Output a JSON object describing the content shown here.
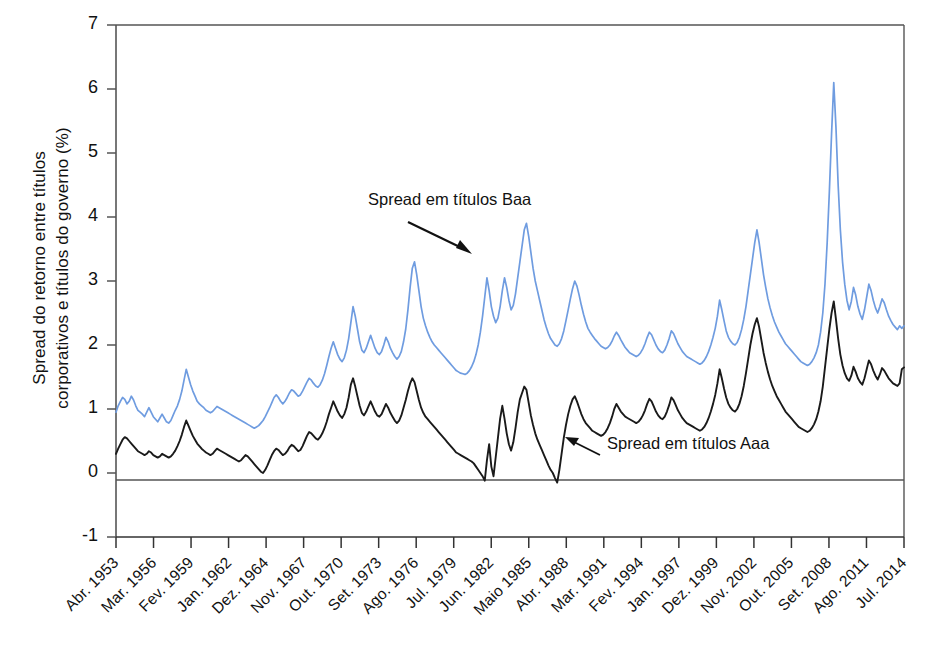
{
  "chart_data": {
    "type": "line",
    "title": "",
    "xlabel": "",
    "ylabel": "Spread do retorno entre títulos corporativos e títulos do governo (%)",
    "ylabel_line1": "Spread do retorno entre títulos",
    "ylabel_line2": "corporativos e títulos do governo (%)",
    "ylim": [
      -1,
      7
    ],
    "yticks": [
      -1,
      0,
      1,
      2,
      3,
      4,
      5,
      6,
      7
    ],
    "ytick_labels": [
      "-1",
      "0",
      "1",
      "2",
      "3",
      "4",
      "5",
      "6",
      "7"
    ],
    "grid": false,
    "zero_line": true,
    "legend_position": "inline-annotations",
    "x_tick_labels": [
      "Abr. 1953",
      "Mar. 1956",
      "Fev. 1959",
      "Jan. 1962",
      "Dez. 1964",
      "Nov. 1967",
      "Out. 1970",
      "Set. 1973",
      "Ago. 1976",
      "Jul. 1979",
      "Jun. 1982",
      "Maio 1985",
      "Abr. 1988",
      "Mar. 1991",
      "Fev. 1994",
      "Jan. 1997",
      "Dez. 1999",
      "Nov. 2002",
      "Out. 2005",
      "Set. 2008",
      "Ago. 2011",
      "Jul. 2014"
    ],
    "x_range": [
      "Abr. 1953",
      "Jul. 2014"
    ],
    "annotations": [
      {
        "text": "Spread em títulos Baa",
        "arrow": "down-right",
        "series": "Baa"
      },
      {
        "text": "Spread em títulos Aaa",
        "arrow": "up-left",
        "series": "Aaa"
      }
    ],
    "series": [
      {
        "name": "Spread em títulos Baa",
        "color": "#6f9ce0",
        "values": [
          0.95,
          1.05,
          1.12,
          1.18,
          1.15,
          1.08,
          1.12,
          1.2,
          1.14,
          1.05,
          0.98,
          0.95,
          0.92,
          0.88,
          0.95,
          1.02,
          0.95,
          0.88,
          0.84,
          0.8,
          0.86,
          0.92,
          0.86,
          0.8,
          0.78,
          0.82,
          0.9,
          0.98,
          1.05,
          1.15,
          1.28,
          1.45,
          1.62,
          1.5,
          1.38,
          1.28,
          1.2,
          1.12,
          1.08,
          1.05,
          1.02,
          0.98,
          0.96,
          0.94,
          0.96,
          1.0,
          1.04,
          1.02,
          1.0,
          0.98,
          0.96,
          0.94,
          0.92,
          0.9,
          0.88,
          0.86,
          0.84,
          0.82,
          0.8,
          0.78,
          0.76,
          0.74,
          0.72,
          0.7,
          0.72,
          0.74,
          0.78,
          0.82,
          0.88,
          0.95,
          1.02,
          1.1,
          1.18,
          1.22,
          1.18,
          1.12,
          1.08,
          1.12,
          1.18,
          1.25,
          1.3,
          1.28,
          1.24,
          1.2,
          1.22,
          1.28,
          1.35,
          1.42,
          1.48,
          1.45,
          1.4,
          1.36,
          1.34,
          1.38,
          1.45,
          1.55,
          1.68,
          1.82,
          1.95,
          2.05,
          1.95,
          1.85,
          1.78,
          1.74,
          1.8,
          1.92,
          2.1,
          2.35,
          2.6,
          2.45,
          2.25,
          2.05,
          1.92,
          1.88,
          1.95,
          2.05,
          2.15,
          2.05,
          1.95,
          1.88,
          1.85,
          1.9,
          2.0,
          2.12,
          2.05,
          1.95,
          1.88,
          1.82,
          1.78,
          1.82,
          1.9,
          2.05,
          2.25,
          2.55,
          2.9,
          3.2,
          3.3,
          3.1,
          2.85,
          2.6,
          2.42,
          2.3,
          2.2,
          2.12,
          2.05,
          2.0,
          1.96,
          1.92,
          1.88,
          1.84,
          1.8,
          1.76,
          1.72,
          1.68,
          1.64,
          1.6,
          1.58,
          1.56,
          1.55,
          1.54,
          1.56,
          1.6,
          1.66,
          1.74,
          1.85,
          2.0,
          2.2,
          2.45,
          2.75,
          3.05,
          2.85,
          2.6,
          2.45,
          2.35,
          2.42,
          2.6,
          2.85,
          3.05,
          2.9,
          2.7,
          2.55,
          2.62,
          2.8,
          3.05,
          3.3,
          3.55,
          3.8,
          3.9,
          3.7,
          3.45,
          3.2,
          3.0,
          2.85,
          2.7,
          2.55,
          2.4,
          2.28,
          2.18,
          2.1,
          2.05,
          2.0,
          1.98,
          2.02,
          2.1,
          2.22,
          2.38,
          2.55,
          2.72,
          2.88,
          3.0,
          2.92,
          2.78,
          2.62,
          2.48,
          2.36,
          2.26,
          2.2,
          2.15,
          2.1,
          2.06,
          2.02,
          1.98,
          1.96,
          1.94,
          1.96,
          2.0,
          2.06,
          2.14,
          2.2,
          2.15,
          2.08,
          2.02,
          1.96,
          1.92,
          1.88,
          1.86,
          1.84,
          1.82,
          1.84,
          1.88,
          1.94,
          2.02,
          2.12,
          2.2,
          2.16,
          2.08,
          2.0,
          1.94,
          1.9,
          1.88,
          1.92,
          2.0,
          2.1,
          2.22,
          2.18,
          2.1,
          2.02,
          1.96,
          1.9,
          1.86,
          1.82,
          1.8,
          1.78,
          1.76,
          1.74,
          1.72,
          1.7,
          1.72,
          1.76,
          1.82,
          1.9,
          2.0,
          2.12,
          2.26,
          2.45,
          2.7,
          2.55,
          2.38,
          2.22,
          2.12,
          2.06,
          2.02,
          2.0,
          2.04,
          2.12,
          2.24,
          2.4,
          2.6,
          2.85,
          3.1,
          3.35,
          3.6,
          3.8,
          3.6,
          3.35,
          3.1,
          2.9,
          2.72,
          2.58,
          2.46,
          2.36,
          2.28,
          2.2,
          2.14,
          2.08,
          2.02,
          1.98,
          1.94,
          1.9,
          1.86,
          1.82,
          1.78,
          1.74,
          1.72,
          1.7,
          1.68,
          1.7,
          1.74,
          1.8,
          1.88,
          2.0,
          2.2,
          2.5,
          2.95,
          3.6,
          4.4,
          5.3,
          6.1,
          5.4,
          4.5,
          3.8,
          3.3,
          2.95,
          2.7,
          2.55,
          2.68,
          2.9,
          2.78,
          2.6,
          2.48,
          2.4,
          2.55,
          2.75,
          2.95,
          2.85,
          2.7,
          2.58,
          2.5,
          2.6,
          2.72,
          2.66,
          2.55,
          2.45,
          2.38,
          2.32,
          2.28,
          2.24,
          2.3,
          2.26,
          2.3
        ]
      },
      {
        "name": "Spread em títulos Aaa",
        "color": "#1a1a1a",
        "values": [
          0.3,
          0.38,
          0.45,
          0.52,
          0.56,
          0.54,
          0.5,
          0.46,
          0.42,
          0.38,
          0.34,
          0.32,
          0.3,
          0.28,
          0.3,
          0.34,
          0.32,
          0.28,
          0.26,
          0.24,
          0.26,
          0.3,
          0.28,
          0.26,
          0.24,
          0.26,
          0.3,
          0.35,
          0.42,
          0.5,
          0.6,
          0.72,
          0.82,
          0.74,
          0.66,
          0.58,
          0.52,
          0.46,
          0.42,
          0.38,
          0.35,
          0.32,
          0.3,
          0.28,
          0.3,
          0.34,
          0.38,
          0.36,
          0.34,
          0.32,
          0.3,
          0.28,
          0.26,
          0.24,
          0.22,
          0.2,
          0.18,
          0.2,
          0.24,
          0.28,
          0.26,
          0.22,
          0.18,
          0.14,
          0.1,
          0.06,
          0.02,
          0.0,
          0.05,
          0.12,
          0.2,
          0.28,
          0.34,
          0.38,
          0.36,
          0.32,
          0.28,
          0.3,
          0.34,
          0.4,
          0.44,
          0.42,
          0.38,
          0.34,
          0.36,
          0.42,
          0.5,
          0.58,
          0.64,
          0.62,
          0.58,
          0.54,
          0.52,
          0.56,
          0.62,
          0.7,
          0.8,
          0.92,
          1.02,
          1.12,
          1.04,
          0.96,
          0.9,
          0.86,
          0.92,
          1.02,
          1.18,
          1.38,
          1.48,
          1.35,
          1.2,
          1.05,
          0.94,
          0.9,
          0.96,
          1.04,
          1.12,
          1.04,
          0.96,
          0.9,
          0.88,
          0.92,
          1.0,
          1.08,
          1.02,
          0.94,
          0.88,
          0.82,
          0.78,
          0.82,
          0.9,
          1.02,
          1.14,
          1.28,
          1.4,
          1.48,
          1.42,
          1.28,
          1.14,
          1.02,
          0.94,
          0.88,
          0.84,
          0.8,
          0.76,
          0.72,
          0.68,
          0.64,
          0.6,
          0.56,
          0.52,
          0.48,
          0.44,
          0.4,
          0.36,
          0.32,
          0.3,
          0.28,
          0.26,
          0.24,
          0.22,
          0.2,
          0.18,
          0.15,
          0.1,
          0.05,
          0.0,
          -0.05,
          -0.12,
          0.2,
          0.45,
          0.1,
          -0.05,
          0.25,
          0.55,
          0.85,
          1.05,
          0.85,
          0.62,
          0.45,
          0.35,
          0.48,
          0.7,
          0.95,
          1.15,
          1.25,
          1.35,
          1.3,
          1.1,
          0.9,
          0.75,
          0.62,
          0.52,
          0.44,
          0.36,
          0.28,
          0.2,
          0.12,
          0.05,
          0.0,
          -0.08,
          -0.15,
          0.05,
          0.3,
          0.55,
          0.75,
          0.92,
          1.05,
          1.15,
          1.2,
          1.12,
          1.02,
          0.92,
          0.84,
          0.78,
          0.74,
          0.7,
          0.66,
          0.64,
          0.62,
          0.6,
          0.58,
          0.6,
          0.64,
          0.7,
          0.78,
          0.88,
          1.0,
          1.08,
          1.02,
          0.96,
          0.92,
          0.88,
          0.86,
          0.84,
          0.82,
          0.8,
          0.78,
          0.8,
          0.84,
          0.9,
          0.98,
          1.08,
          1.16,
          1.12,
          1.04,
          0.96,
          0.9,
          0.86,
          0.84,
          0.88,
          0.96,
          1.06,
          1.18,
          1.14,
          1.06,
          0.98,
          0.92,
          0.86,
          0.82,
          0.78,
          0.76,
          0.74,
          0.72,
          0.7,
          0.68,
          0.66,
          0.68,
          0.72,
          0.78,
          0.86,
          0.96,
          1.08,
          1.22,
          1.4,
          1.62,
          1.48,
          1.32,
          1.18,
          1.08,
          1.02,
          0.98,
          0.96,
          1.0,
          1.08,
          1.2,
          1.36,
          1.56,
          1.78,
          2.0,
          2.18,
          2.32,
          2.42,
          2.28,
          2.08,
          1.88,
          1.72,
          1.58,
          1.46,
          1.36,
          1.28,
          1.2,
          1.14,
          1.08,
          1.02,
          0.96,
          0.92,
          0.88,
          0.84,
          0.8,
          0.76,
          0.72,
          0.7,
          0.68,
          0.66,
          0.64,
          0.66,
          0.7,
          0.76,
          0.84,
          0.96,
          1.12,
          1.35,
          1.65,
          1.95,
          2.25,
          2.5,
          2.68,
          2.4,
          2.1,
          1.85,
          1.68,
          1.56,
          1.48,
          1.44,
          1.52,
          1.66,
          1.58,
          1.48,
          1.42,
          1.38,
          1.48,
          1.62,
          1.76,
          1.7,
          1.6,
          1.52,
          1.46,
          1.54,
          1.64,
          1.6,
          1.54,
          1.48,
          1.44,
          1.4,
          1.38,
          1.36,
          1.4,
          1.62,
          1.65
        ]
      }
    ]
  },
  "ylabel_text": {
    "line1": "Spread do retorno entre títulos",
    "line2": "corporativos e títulos do governo (%)"
  },
  "annotations": {
    "baa": "Spread em títulos Baa",
    "aaa": "Spread em títulos Aaa"
  },
  "colors": {
    "baa_line": "#6f9ce0",
    "aaa_line": "#1a1a1a",
    "axis": "#555555",
    "background": "#ffffff"
  }
}
